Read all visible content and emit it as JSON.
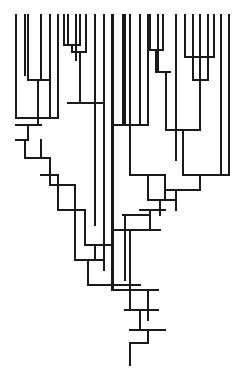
{
  "diagram": {
    "type": "dendrogram",
    "orientation": "root-bottom",
    "stroke_color": "#1a1a1a",
    "background": "#ffffff",
    "leaf_top_y": 15,
    "root": {
      "x": 130,
      "y_top": 343,
      "y_bottom": 365
    },
    "segments": [
      [
        16,
        15,
        16,
        118
      ],
      [
        25,
        15,
        25,
        75
      ],
      [
        28,
        15,
        28,
        80
      ],
      [
        41,
        15,
        41,
        80
      ],
      [
        50,
        15,
        50,
        118
      ],
      [
        58,
        15,
        58,
        118
      ],
      [
        64,
        15,
        64,
        45
      ],
      [
        68,
        15,
        68,
        45
      ],
      [
        76,
        15,
        76,
        52
      ],
      [
        80,
        15,
        80,
        45
      ],
      [
        86,
        15,
        86,
        52
      ],
      [
        95,
        15,
        95,
        103
      ],
      [
        104,
        15,
        104,
        125
      ],
      [
        112,
        15,
        112,
        290
      ],
      [
        113,
        15,
        113,
        290
      ],
      [
        123,
        15,
        123,
        125
      ],
      [
        125,
        15,
        125,
        125
      ],
      [
        130,
        15,
        130,
        125
      ],
      [
        140,
        15,
        140,
        125
      ],
      [
        148,
        15,
        148,
        125
      ],
      [
        150,
        15,
        150,
        50
      ],
      [
        158,
        15,
        158,
        72
      ],
      [
        163,
        15,
        163,
        50
      ],
      [
        176,
        15,
        176,
        130
      ],
      [
        185,
        15,
        185,
        57
      ],
      [
        193,
        15,
        193,
        80
      ],
      [
        200,
        15,
        200,
        130
      ],
      [
        208,
        15,
        208,
        80
      ],
      [
        214,
        15,
        214,
        57
      ],
      [
        221,
        15,
        221,
        175
      ],
      [
        229,
        15,
        229,
        175
      ],
      [
        64,
        45,
        80,
        45
      ],
      [
        72,
        45,
        72,
        52
      ],
      [
        72,
        52,
        86,
        52
      ],
      [
        80,
        52,
        80,
        103
      ],
      [
        76,
        52,
        76,
        60
      ],
      [
        28,
        80,
        50,
        80
      ],
      [
        38,
        80,
        38,
        118
      ],
      [
        16,
        118,
        58,
        118
      ],
      [
        38,
        118,
        38,
        125
      ],
      [
        68,
        103,
        103,
        103
      ],
      [
        95,
        103,
        95,
        150
      ],
      [
        150,
        50,
        163,
        50
      ],
      [
        156,
        50,
        156,
        72
      ],
      [
        158,
        72,
        170,
        72
      ],
      [
        166,
        72,
        166,
        130
      ],
      [
        185,
        57,
        214,
        57
      ],
      [
        200,
        57,
        200,
        80
      ],
      [
        193,
        80,
        208,
        80
      ],
      [
        200,
        80,
        200,
        130
      ],
      [
        112,
        125,
        148,
        125
      ],
      [
        130,
        125,
        130,
        175
      ],
      [
        166,
        130,
        200,
        130
      ],
      [
        183,
        130,
        183,
        175
      ],
      [
        176,
        130,
        176,
        160
      ],
      [
        16,
        125,
        41,
        125
      ],
      [
        28,
        125,
        28,
        140
      ],
      [
        16,
        140,
        28,
        140
      ],
      [
        25,
        140,
        25,
        158
      ],
      [
        41,
        140,
        41,
        158
      ],
      [
        25,
        158,
        50,
        158
      ],
      [
        50,
        158,
        50,
        185
      ],
      [
        41,
        175,
        58,
        175
      ],
      [
        58,
        175,
        58,
        210
      ],
      [
        50,
        185,
        75,
        185
      ],
      [
        75,
        185,
        75,
        260
      ],
      [
        58,
        210,
        85,
        210
      ],
      [
        85,
        210,
        85,
        245
      ],
      [
        130,
        175,
        165,
        175
      ],
      [
        148,
        175,
        148,
        200
      ],
      [
        165,
        175,
        165,
        200
      ],
      [
        183,
        175,
        229,
        175
      ],
      [
        200,
        175,
        200,
        190
      ],
      [
        165,
        190,
        200,
        190
      ],
      [
        176,
        190,
        176,
        210
      ],
      [
        148,
        200,
        176,
        200
      ],
      [
        160,
        200,
        160,
        215
      ],
      [
        140,
        210,
        165,
        210
      ],
      [
        150,
        210,
        150,
        230
      ],
      [
        123,
        215,
        150,
        215
      ],
      [
        125,
        215,
        125,
        280
      ],
      [
        112,
        230,
        160,
        230
      ],
      [
        130,
        230,
        130,
        290
      ],
      [
        95,
        150,
        95,
        225
      ],
      [
        104,
        125,
        104,
        270
      ],
      [
        85,
        245,
        112,
        245
      ],
      [
        95,
        245,
        95,
        260
      ],
      [
        75,
        260,
        104,
        260
      ],
      [
        88,
        260,
        88,
        285
      ],
      [
        88,
        285,
        140,
        285
      ],
      [
        130,
        285,
        130,
        310
      ],
      [
        113,
        290,
        158,
        290
      ],
      [
        148,
        290,
        148,
        320
      ],
      [
        125,
        310,
        158,
        310
      ],
      [
        140,
        310,
        140,
        330
      ],
      [
        130,
        330,
        165,
        330
      ],
      [
        148,
        330,
        148,
        343
      ],
      [
        130,
        343,
        148,
        343
      ],
      [
        130,
        343,
        130,
        365
      ]
    ]
  }
}
